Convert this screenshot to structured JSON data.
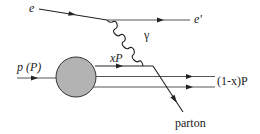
{
  "diagram": {
    "labels": {
      "electron_in": "e",
      "electron_out": "e'",
      "photon": "γ",
      "proton": "p (P)",
      "parton_momentum": "xP",
      "remnant": "(1-x)P",
      "parton_out": "parton"
    },
    "colors": {
      "line": "#222222",
      "blob_fill": "#b3b3b3",
      "blob_stroke": "#333333"
    },
    "nodes": {
      "electron_vertex": {
        "x": 107,
        "y": 20
      },
      "photon_parton_vertex": {
        "x": 153,
        "y": 66
      },
      "proton_blob": {
        "cx": 76,
        "cy": 77,
        "r": 20
      }
    }
  }
}
